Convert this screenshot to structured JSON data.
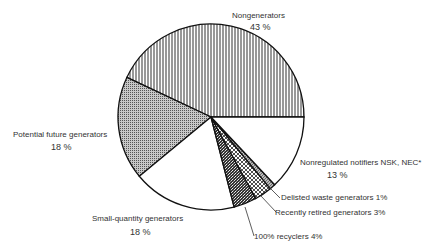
{
  "chart_data": {
    "type": "pie",
    "title": "",
    "start_angle_deg": 0,
    "direction": "counterclockwise",
    "slices": [
      {
        "label": "Nongenerators",
        "value": 43,
        "display": "43 %",
        "pattern": "vertical-lines"
      },
      {
        "label": "Potential future generators",
        "value": 18,
        "display": "18 %",
        "pattern": "fine-dots"
      },
      {
        "label": "Small-quantity generators",
        "value": 18,
        "display": "18 %",
        "pattern": "none"
      },
      {
        "label": "100% recyclers",
        "value": 4,
        "display": "4%",
        "pattern": "dense-stipple"
      },
      {
        "label": "Recently retired generators",
        "value": 3,
        "display": "3%",
        "pattern": "crosshatch"
      },
      {
        "label": "Delisted waste generators",
        "value": 1,
        "display": "1%",
        "pattern": "diagonal-lines"
      },
      {
        "label": "Nonregulated notifiers NSK, NEC*",
        "value": 13,
        "display": "13 %",
        "pattern": "none"
      }
    ]
  },
  "labels": {
    "nongen_name": "Nongenerators",
    "nongen_pct": "43 %",
    "potential_name": "Potential future generators",
    "potential_pct": "18 %",
    "smallq_name": "Small-quantity generators",
    "smallq_pct": "18 %",
    "nonreg_name": "Nonregulated notifiers NSK, NEC*",
    "nonreg_pct": "13 %",
    "delisted": "Delisted waste generators 1%",
    "retired": "Recently retired generators 3%",
    "recyclers": "100% recyclers 4%"
  }
}
